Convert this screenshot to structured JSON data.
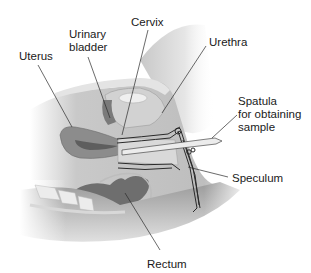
{
  "diagram": {
    "style": "grayscale anatomical illustration",
    "labels": [
      {
        "id": "uterus",
        "text": "Uterus"
      },
      {
        "id": "urinary-bladder",
        "text": "Urinary\nbladder"
      },
      {
        "id": "cervix",
        "text": "Cervix"
      },
      {
        "id": "urethra",
        "text": "Urethra"
      },
      {
        "id": "spatula",
        "text": "Spatula\nfor obtaining\nsample"
      },
      {
        "id": "speculum",
        "text": "Speculum"
      },
      {
        "id": "rectum",
        "text": "Rectum"
      }
    ]
  }
}
